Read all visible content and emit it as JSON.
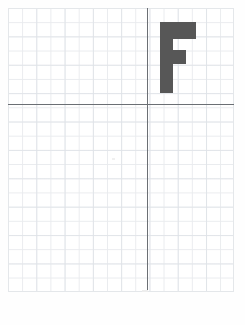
{
  "document": {
    "type": "graph-paper-worksheet",
    "description": "Scanned coordinate grid worksheet with a gray block letter F plotted in the first quadrant",
    "background_color": "#ffffff"
  },
  "grid": {
    "name": "graph-paper-grid",
    "minor_line_color": "#e9ebee",
    "major_line_color": "#dee2e7",
    "cell_size_px": 14.15,
    "columns": 16,
    "rows": 20,
    "left_px": 8,
    "top_px": 8,
    "width_px": 226,
    "height_px": 284
  },
  "axes": {
    "color": "#6b6f74",
    "origin": {
      "x_px": 147,
      "y_px": 104
    },
    "x_axis": {
      "name": "horizontal-axis",
      "label": ""
    },
    "y_axis": {
      "name": "vertical-axis",
      "label": ""
    }
  },
  "shape": {
    "name": "letter-f",
    "glyph": "F",
    "fill_color": "#575757",
    "quadrant": "I",
    "bounds_px": {
      "left": 160,
      "top": 22,
      "width": 36,
      "height": 71
    },
    "parts": [
      {
        "name": "f-stem",
        "left": 0,
        "top": 0,
        "width": 13,
        "height": 71
      },
      {
        "name": "f-top-bar",
        "left": 0,
        "top": 0,
        "width": 36,
        "height": 17
      },
      {
        "name": "f-middle-bar",
        "left": 0,
        "top": 28,
        "width": 26,
        "height": 14
      }
    ]
  },
  "annotations": {
    "title": "",
    "caption": ""
  }
}
